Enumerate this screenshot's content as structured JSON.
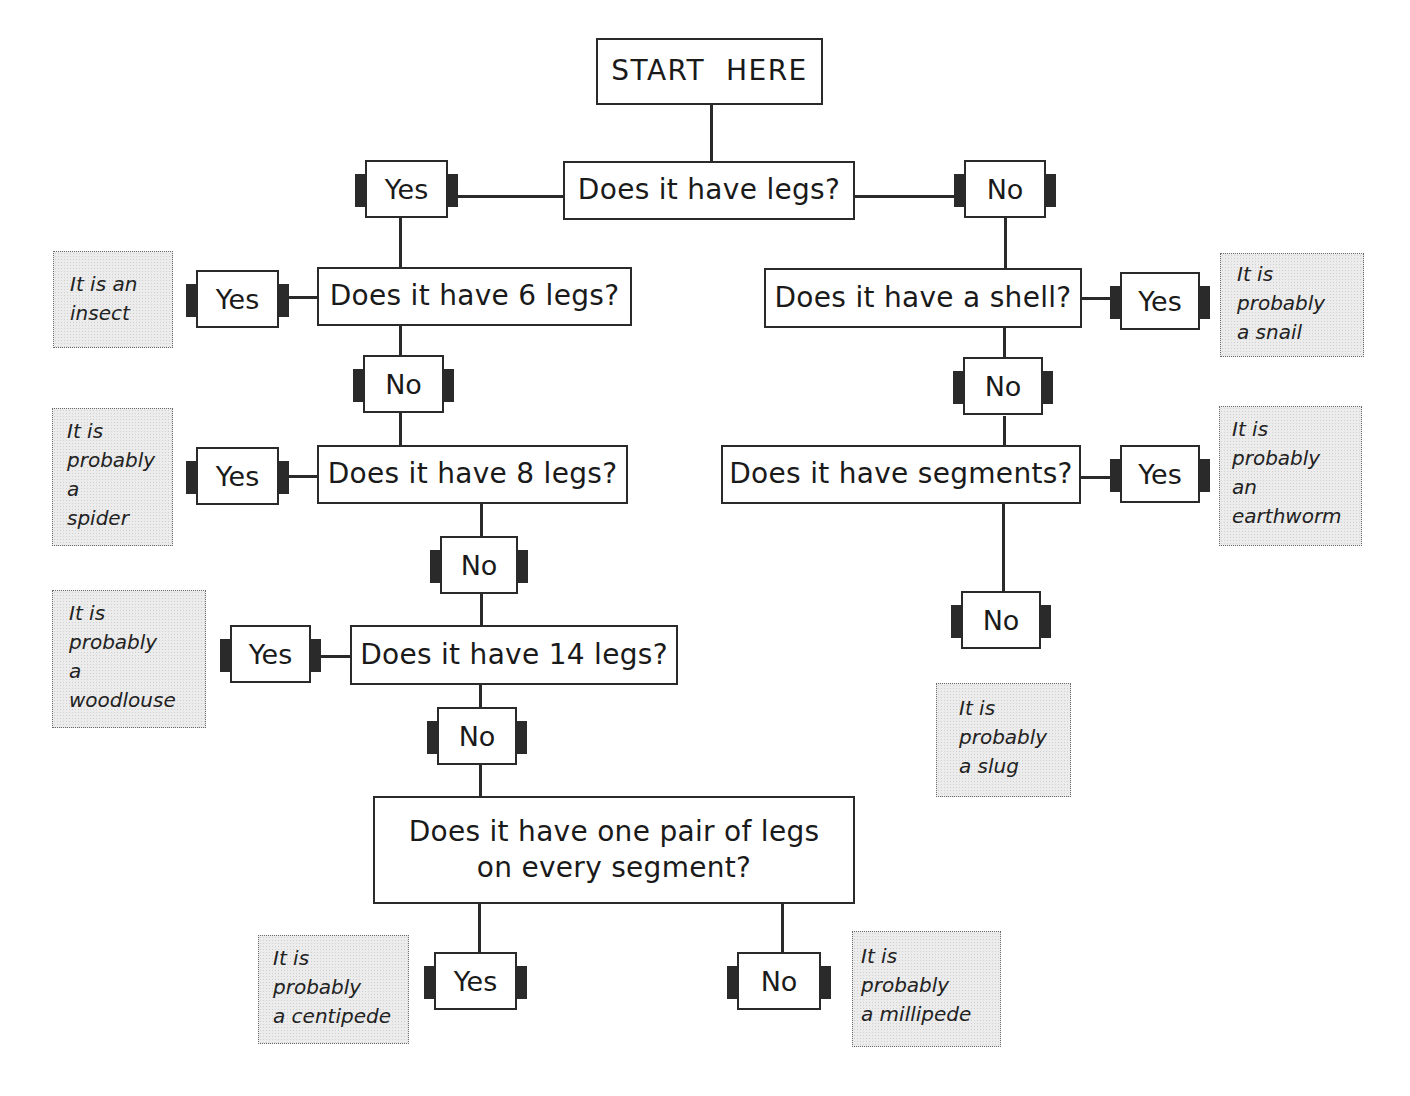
{
  "header": {
    "cutoff_text": "Use this branching diagram to identify your invertebrate"
  },
  "start": {
    "label": "START  HERE"
  },
  "questions": {
    "legs": "Does it have legs?",
    "six_legs": "Does it have 6 legs?",
    "eight_legs": "Does it have 8 legs?",
    "fourteen_legs": "Does it have 14 legs?",
    "pair_per_segment": "Does it have one pair of legs on every segment?",
    "shell": "Does it have a shell?",
    "segments": "Does it have segments?"
  },
  "answers": {
    "yes": "Yes",
    "no": "No"
  },
  "results": {
    "insect": "It is an\ninsect",
    "spider": "It is\nprobably\na\nspider",
    "woodlouse": "It is\nprobably\na\nwoodlouse",
    "centipede": "It is\nprobably\na centipede",
    "millipede": "It is\nprobably\na millipede",
    "snail": "It is\nprobably\na snail",
    "earthworm": "It is\nprobably\nan\nearthworm",
    "slug": "It is\nprobably\na slug"
  },
  "colors": {
    "line": "#2a2a2a",
    "result_fill": "#ececec",
    "result_border": "#6a6a6a"
  }
}
